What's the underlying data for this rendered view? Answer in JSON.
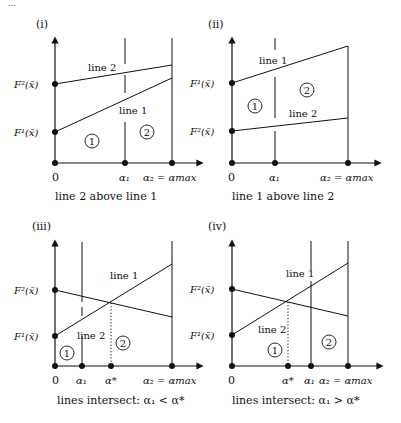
{
  "header_fragment": "...",
  "panels": [
    {
      "id": "i",
      "label": "(i)",
      "caption": "line 2 above line 1",
      "y_labels": {
        "upper": "F²(x̄)",
        "lower": "F¹(x̄)"
      },
      "x_labels": {
        "origin": "0",
        "a1": "α₁",
        "amax": "α₂ = αmax"
      },
      "line_labels": {
        "top": "line 2",
        "bottom": "line 1"
      },
      "regions": [
        "1",
        "2"
      ]
    },
    {
      "id": "ii",
      "label": "(ii)",
      "caption": "line 1 above line 2",
      "y_labels": {
        "upper": "F¹(x̄)",
        "lower": "F²(x̄)"
      },
      "x_labels": {
        "origin": "0",
        "a1": "α₁",
        "amax": "α₂ = αmax"
      },
      "line_labels": {
        "top": "line 1",
        "bottom": "line 2"
      },
      "regions": [
        "1",
        "2"
      ]
    },
    {
      "id": "iii",
      "label": "(iii)",
      "caption": "lines intersect: α₁ < α*",
      "y_labels": {
        "upper": "F²(x̄)",
        "lower": "F¹(x̄)"
      },
      "x_labels": {
        "origin": "0",
        "a1": "α₁",
        "astar": "α*",
        "amax": "α₂ = αmax"
      },
      "line_labels": {
        "top": "line 1",
        "bottom": "line 2"
      },
      "regions": [
        "1",
        "2"
      ]
    },
    {
      "id": "iv",
      "label": "(iv)",
      "caption": "lines intersect: α₁ > α*",
      "y_labels": {
        "upper": "F²(x̄)",
        "lower": "F¹(x̄)"
      },
      "x_labels": {
        "origin": "0",
        "astar": "α*",
        "a1": "α₁",
        "amax": "α₂ = αmax"
      },
      "line_labels": {
        "top": "line 1",
        "bottom": "line 2"
      },
      "regions": [
        "1",
        "2"
      ]
    }
  ]
}
